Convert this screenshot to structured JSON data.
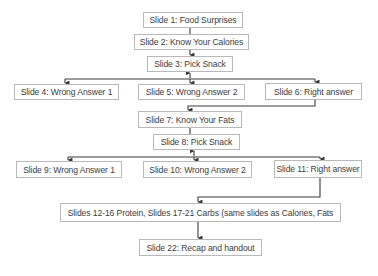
{
  "diagram": {
    "type": "flowchart",
    "nodes": [
      {
        "id": "slide1",
        "label": "Slide 1: Food Surprises",
        "x": 143,
        "y": 12,
        "w": 100,
        "h": 16
      },
      {
        "id": "slide2",
        "label": "Slide 2: Know Your Calories",
        "x": 134,
        "y": 34,
        "w": 115,
        "h": 16
      },
      {
        "id": "slide3",
        "label": "Slide 3: Pick Snack",
        "x": 147,
        "y": 56,
        "w": 86,
        "h": 16
      },
      {
        "id": "slide4",
        "label": "Slide 4: Wrong Answer 1",
        "x": 14,
        "y": 84,
        "w": 105,
        "h": 16
      },
      {
        "id": "slide5",
        "label": "Slide 5: Wrong Answer 2",
        "x": 138,
        "y": 84,
        "w": 107,
        "h": 16
      },
      {
        "id": "slide6",
        "label": "Slide 6: Right answer",
        "x": 265,
        "y": 83,
        "w": 97,
        "h": 17
      },
      {
        "id": "slide7",
        "label": "Slide 7: Know Your Fats",
        "x": 138,
        "y": 111,
        "w": 104,
        "h": 17
      },
      {
        "id": "slide8",
        "label": "Slide 8: Pick Snack",
        "x": 153,
        "y": 134,
        "w": 87,
        "h": 16
      },
      {
        "id": "slide9",
        "label": "Slide 9: Wrong Answer 1",
        "x": 16,
        "y": 161,
        "w": 106,
        "h": 17
      },
      {
        "id": "slide10",
        "label": "Slide 10: Wrong Answer 2",
        "x": 143,
        "y": 161,
        "w": 109,
        "h": 17
      },
      {
        "id": "slide11",
        "label": "Slide 11: Right answer",
        "x": 274,
        "y": 160,
        "w": 88,
        "h": 18
      },
      {
        "id": "slides12_21",
        "label": "Slides 12-16 Protein, Slides 17-21 Carbs (same slides as Calories, Fats",
        "x": 60,
        "y": 203,
        "w": 281,
        "h": 19
      },
      {
        "id": "slide22",
        "label": "Slide 22: Recap and handout",
        "x": 139,
        "y": 239,
        "w": 123,
        "h": 17
      }
    ],
    "edges": [
      {
        "from": "slide1",
        "to": "slide2",
        "arrow": false
      },
      {
        "from": "slide2",
        "to": "slide3",
        "arrow": true
      },
      {
        "from": "slide3",
        "to": "slide4",
        "arrow": true,
        "bidirectional": true
      },
      {
        "from": "slide3",
        "to": "slide5",
        "arrow": true,
        "bidirectional": true
      },
      {
        "from": "slide3",
        "to": "slide6",
        "arrow": true,
        "bidirectional": true
      },
      {
        "from": "slide6",
        "to": "slide7",
        "arrow": true
      },
      {
        "from": "slide7",
        "to": "slide8",
        "arrow": false
      },
      {
        "from": "slide8",
        "to": "slide9",
        "arrow": true,
        "bidirectional": true
      },
      {
        "from": "slide8",
        "to": "slide10",
        "arrow": true,
        "bidirectional": true
      },
      {
        "from": "slide8",
        "to": "slide11",
        "arrow": true,
        "bidirectional": true
      },
      {
        "from": "slide11",
        "to": "slides12_21",
        "arrow": true
      },
      {
        "from": "slides12_21",
        "to": "slide22",
        "arrow": true
      }
    ],
    "colors": {
      "line": "#3a3a3a",
      "box_border": "#b9b9b9",
      "text": "#3d3d3d",
      "background": "#ffffff"
    }
  }
}
